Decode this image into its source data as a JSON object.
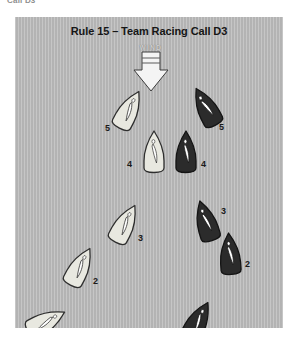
{
  "page": {
    "cropped_header_text": "Call D3",
    "background_color": "#ffffff"
  },
  "diagram": {
    "title": "Rule 15 – Team Racing Call D3",
    "background_color": "#b6b6b6",
    "wind": {
      "label": "WIND",
      "direction": "down",
      "arrow_fill": "#f2f2f2",
      "arrow_stroke": "#3a3a3a"
    },
    "legend_colors": {
      "light_boat_fill": "#e8e8e0",
      "light_boat_stroke": "#2e2e2e",
      "dark_boat_fill": "#2b2b2b",
      "dark_boat_stroke": "#141414",
      "sail_light": "#ffffff",
      "sail_dark": "#ffffff"
    },
    "boats": [
      {
        "id": "boat-light-5",
        "label": "5",
        "team": "light",
        "x": 101,
        "y": 71,
        "rotation": 28,
        "label_dx": -11,
        "label_dy": 36
      },
      {
        "id": "boat-dark-5",
        "label": "5",
        "team": "dark",
        "x": 178,
        "y": 68,
        "rotation": -28,
        "label_dx": 26,
        "label_dy": 38
      },
      {
        "id": "boat-light-4",
        "label": "4",
        "team": "light",
        "x": 126,
        "y": 113,
        "rotation": 0,
        "label_dx": -14,
        "label_dy": 30
      },
      {
        "id": "boat-dark-4",
        "label": "4",
        "team": "dark",
        "x": 158,
        "y": 113,
        "rotation": 0,
        "label_dx": 28,
        "label_dy": 30
      },
      {
        "id": "boat-light-3",
        "label": "3",
        "team": "light",
        "x": 97,
        "y": 185,
        "rotation": 28,
        "label_dx": 26,
        "label_dy": 32
      },
      {
        "id": "boat-dark-3",
        "label": "3",
        "team": "dark",
        "x": 178,
        "y": 182,
        "rotation": -17,
        "label_dx": 28,
        "label_dy": 8
      },
      {
        "id": "boat-light-2",
        "label": "2",
        "team": "light",
        "x": 52,
        "y": 228,
        "rotation": 28,
        "label_dx": 26,
        "label_dy": 32
      },
      {
        "id": "boat-dark-2",
        "label": "2",
        "team": "dark",
        "x": 202,
        "y": 215,
        "rotation": -4,
        "label_dx": 28,
        "label_dy": 28
      },
      {
        "id": "boat-light-1",
        "label": "1",
        "team": "light",
        "x": 18,
        "y": 283,
        "rotation": 62,
        "label_dx": 26,
        "label_dy": 38
      },
      {
        "id": "boat-dark-1",
        "label": "1",
        "team": "dark",
        "x": 170,
        "y": 282,
        "rotation": 28,
        "label_dx": 26,
        "label_dy": 38
      }
    ]
  }
}
